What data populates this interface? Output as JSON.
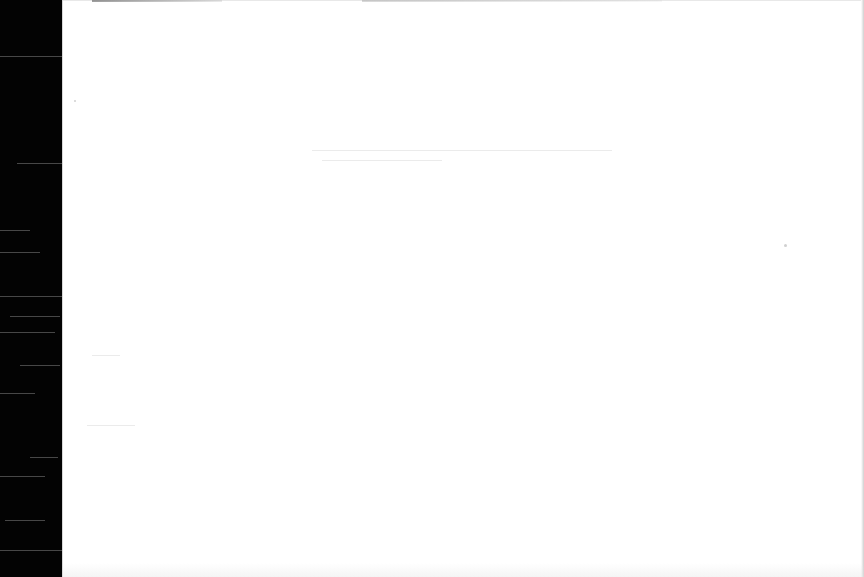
{
  "document": {
    "type": "blank-scanned-page",
    "visible_text": "",
    "colors": {
      "page": "#ffffff",
      "scan_margin": "#030303"
    }
  }
}
